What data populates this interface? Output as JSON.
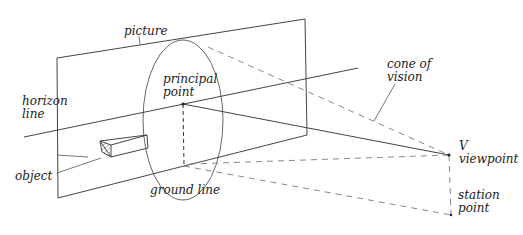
{
  "diagram": {
    "type": "perspective projection diagram",
    "labels": {
      "picture": "picture",
      "principal_point_1": "principal",
      "principal_point_2": "point",
      "horizon_line_1": "horizon",
      "horizon_line_2": "line",
      "object": "object",
      "ground_line": "ground line",
      "cone_of_vision_1": "cone of",
      "cone_of_vision_2": "vision",
      "viewpoint_letter": "V",
      "viewpoint": "viewpoint",
      "station_point_1": "station",
      "station_point_2": "point"
    },
    "colors": {
      "line": "#444444",
      "dashed": "#888888",
      "text": "#222222"
    }
  }
}
